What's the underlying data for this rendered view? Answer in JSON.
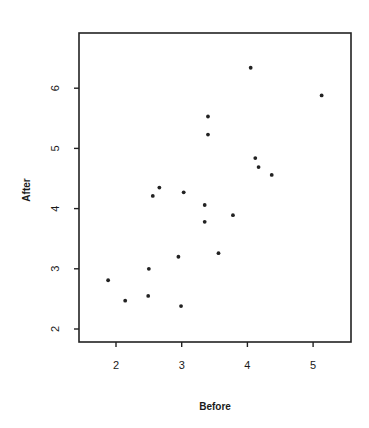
{
  "chart_data": {
    "type": "scatter",
    "title": "",
    "xlabel": "Before",
    "ylabel": "After",
    "xlim": [
      1.6,
      5.5
    ],
    "ylim": [
      1.8,
      6.95
    ],
    "xticks": [
      2,
      3,
      4,
      5
    ],
    "yticks": [
      2,
      3,
      4,
      5,
      6
    ],
    "grid": false,
    "legend": null,
    "series": [
      {
        "name": "Before vs After",
        "points": [
          {
            "x": 1.88,
            "y": 2.81
          },
          {
            "x": 2.14,
            "y": 2.47
          },
          {
            "x": 2.5,
            "y": 3.0
          },
          {
            "x": 2.49,
            "y": 2.55
          },
          {
            "x": 2.95,
            "y": 3.2
          },
          {
            "x": 2.99,
            "y": 2.38
          },
          {
            "x": 2.66,
            "y": 4.35
          },
          {
            "x": 2.56,
            "y": 4.21
          },
          {
            "x": 3.03,
            "y": 4.27
          },
          {
            "x": 3.35,
            "y": 4.06
          },
          {
            "x": 3.35,
            "y": 3.78
          },
          {
            "x": 3.78,
            "y": 3.89
          },
          {
            "x": 3.56,
            "y": 3.26
          },
          {
            "x": 4.05,
            "y": 6.34
          },
          {
            "x": 5.13,
            "y": 5.88
          },
          {
            "x": 3.4,
            "y": 5.53
          },
          {
            "x": 3.4,
            "y": 5.23
          },
          {
            "x": 4.12,
            "y": 4.84
          },
          {
            "x": 4.17,
            "y": 4.69
          },
          {
            "x": 4.37,
            "y": 4.56
          }
        ]
      }
    ]
  },
  "layout": {
    "frame": {
      "left": 79,
      "top": 33,
      "right": 351,
      "bottom": 342
    },
    "x_px": {
      "at2": 116,
      "per_unit": 65.7
    },
    "y_px": {
      "at2": 329,
      "per_unit": 60.2
    }
  }
}
